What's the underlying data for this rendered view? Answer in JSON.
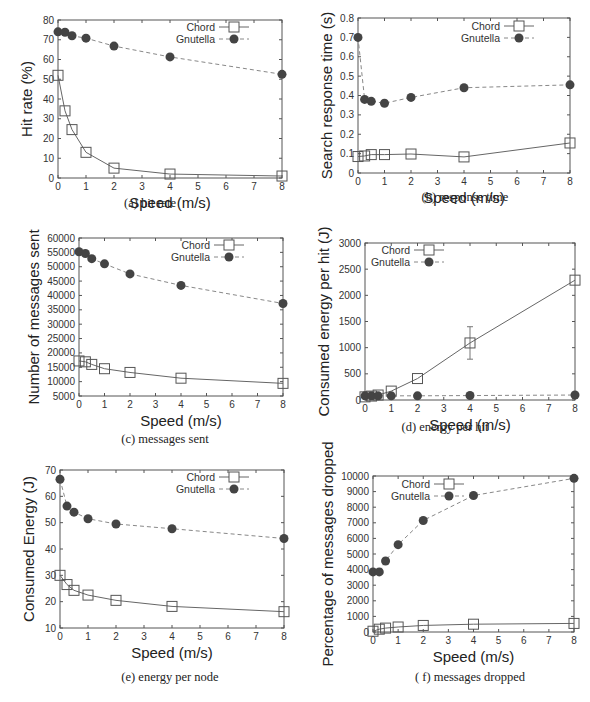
{
  "figure": {
    "legend": {
      "series": [
        "Chord",
        "Gnutella"
      ]
    },
    "colors": {
      "chord": "#555555",
      "gnutella": "#444444",
      "frame": "#555555"
    }
  },
  "chart_data": [
    {
      "id": "a",
      "type": "line",
      "caption": "(a) hit rate",
      "title": "",
      "xlabel": "Speed (m/s)",
      "ylabel": "Hit rate (%)",
      "xlim": [
        0,
        8
      ],
      "ylim": [
        0,
        80
      ],
      "xticks": [
        0,
        1,
        2,
        3,
        4,
        5,
        6,
        7,
        8
      ],
      "yticks": [
        0,
        10,
        20,
        30,
        40,
        50,
        60,
        70,
        80
      ],
      "grid": false,
      "legend_position": "top-right",
      "x": [
        0,
        0.25,
        0.5,
        1,
        2,
        4,
        8
      ],
      "series": [
        {
          "name": "Chord",
          "marker": "open-square",
          "line": "solid",
          "values": [
            52,
            34,
            24.5,
            13,
            5,
            2,
            1
          ]
        },
        {
          "name": "Gnutella",
          "marker": "filled-circle",
          "line": "dashed",
          "values": [
            74,
            73.8,
            72,
            70.8,
            66.8,
            61.3,
            52.5
          ]
        }
      ],
      "frame": {
        "left": 58,
        "top": 20,
        "right": 282,
        "bottom": 178
      }
    },
    {
      "id": "b",
      "type": "line",
      "caption": "(b) response time",
      "title": "",
      "xlabel": "Speed (m/s)",
      "ylabel": "Search response time (s)",
      "xlim": [
        0,
        8
      ],
      "ylim": [
        0,
        0.8
      ],
      "xticks": [
        0,
        1,
        2,
        3,
        4,
        5,
        6,
        7,
        8
      ],
      "yticks": [
        0,
        0.1,
        0.2,
        0.3,
        0.4,
        0.5,
        0.6,
        0.7,
        0.8
      ],
      "grid": false,
      "legend_position": "top-right",
      "x": [
        0,
        0.25,
        0.5,
        1,
        2,
        4,
        8
      ],
      "series": [
        {
          "name": "Chord",
          "marker": "open-square",
          "line": "solid",
          "values": [
            0.085,
            0.088,
            0.095,
            0.095,
            0.098,
            0.083,
            0.155
          ]
        },
        {
          "name": "Gnutella",
          "marker": "filled-circle",
          "line": "dashed",
          "values": [
            0.7,
            0.38,
            0.37,
            0.36,
            0.39,
            0.44,
            0.455
          ]
        }
      ],
      "frame": {
        "left": 358,
        "top": 18,
        "right": 570,
        "bottom": 173
      }
    },
    {
      "id": "c",
      "type": "line",
      "caption": "(c) messages sent",
      "title": "",
      "xlabel": "Speed (m/s)",
      "ylabel": "Number of messages sent",
      "xlim": [
        0,
        8
      ],
      "ylim": [
        5000,
        60000
      ],
      "xticks": [
        0,
        1,
        2,
        3,
        4,
        5,
        6,
        7,
        8
      ],
      "yticks": [
        5000,
        10000,
        15000,
        20000,
        25000,
        30000,
        35000,
        40000,
        45000,
        50000,
        55000,
        60000
      ],
      "grid": false,
      "legend_position": "top-right",
      "x": [
        0,
        0.25,
        0.5,
        1,
        2,
        4,
        8
      ],
      "series": [
        {
          "name": "Chord",
          "marker": "open-square",
          "line": "solid",
          "values": [
            17200,
            16900,
            16000,
            14500,
            13200,
            11200,
            9400
          ]
        },
        {
          "name": "Gnutella",
          "marker": "filled-circle",
          "line": "dashed",
          "values": [
            55200,
            54600,
            52800,
            51000,
            47500,
            43500,
            37200
          ]
        }
      ],
      "frame": {
        "left": 79,
        "top": 238,
        "right": 283,
        "bottom": 396
      }
    },
    {
      "id": "d",
      "type": "line",
      "caption": "(d) energy per hit",
      "title": "",
      "xlabel": "Speed (m/s)",
      "ylabel": "Consumed energy per hit (J)",
      "xlim": [
        0,
        8
      ],
      "ylim": [
        0,
        3000
      ],
      "xticks": [
        0,
        1,
        2,
        3,
        4,
        5,
        6,
        7,
        8
      ],
      "yticks": [
        0,
        500,
        1000,
        1500,
        2000,
        2500,
        3000
      ],
      "grid": false,
      "legend_position": "top-left",
      "error_bars": {
        "Chord": {
          "x": 4,
          "low": 780,
          "high": 1400
        }
      },
      "x": [
        0,
        0.25,
        0.5,
        1,
        2,
        4,
        8
      ],
      "series": [
        {
          "name": "Chord",
          "marker": "open-square",
          "line": "solid",
          "values": [
            60,
            75,
            95,
            170,
            410,
            1090,
            2290
          ]
        },
        {
          "name": "Gnutella",
          "marker": "filled-circle",
          "line": "dashed",
          "values": [
            80,
            80,
            80,
            80,
            80,
            85,
            95
          ]
        }
      ],
      "frame": {
        "left": 365,
        "top": 243,
        "right": 575,
        "bottom": 400
      }
    },
    {
      "id": "e",
      "type": "line",
      "caption": "(e) energy per node",
      "title": "",
      "xlabel": "Speed (m/s)",
      "ylabel": "Consumed Energy (J)",
      "xlim": [
        0,
        8
      ],
      "ylim": [
        10,
        70
      ],
      "xticks": [
        0,
        1,
        2,
        3,
        4,
        5,
        6,
        7,
        8
      ],
      "yticks": [
        10,
        20,
        30,
        40,
        50,
        60,
        70
      ],
      "grid": false,
      "legend_position": "top-right",
      "x": [
        0,
        0.25,
        0.5,
        1,
        2,
        4,
        8
      ],
      "series": [
        {
          "name": "Chord",
          "marker": "open-square",
          "line": "solid",
          "values": [
            30,
            26.5,
            24.3,
            22.5,
            20.5,
            18.2,
            16.2
          ]
        },
        {
          "name": "Gnutella",
          "marker": "filled-circle",
          "line": "dashed",
          "values": [
            66.5,
            56.3,
            54,
            51.5,
            49.5,
            47.7,
            44
          ]
        }
      ],
      "frame": {
        "left": 60,
        "top": 470,
        "right": 284,
        "bottom": 628
      }
    },
    {
      "id": "f",
      "type": "line",
      "caption": "( f) messages dropped",
      "title": "",
      "xlabel": "Speed (m/s)",
      "ylabel": "Percentage of messages dropped",
      "xlim": [
        0,
        8
      ],
      "ylim": [
        0,
        10000
      ],
      "xticks": [
        0,
        1,
        2,
        3,
        4,
        5,
        6,
        7,
        8
      ],
      "yticks": [
        0,
        1000,
        2000,
        3000,
        4000,
        5000,
        6000,
        7000,
        8000,
        9000,
        10000
      ],
      "grid": false,
      "legend_position": "top-center",
      "x": [
        0,
        0.25,
        0.5,
        1,
        2,
        4,
        8
      ],
      "series": [
        {
          "name": "Chord",
          "marker": "open-square",
          "line": "solid",
          "values": [
            50,
            180,
            250,
            320,
            420,
            500,
            550
          ]
        },
        {
          "name": "Gnutella",
          "marker": "filled-circle",
          "line": "dashed",
          "values": [
            3850,
            3850,
            4550,
            5600,
            7150,
            8750,
            9850
          ]
        }
      ],
      "frame": {
        "left": 373,
        "top": 476,
        "right": 574,
        "bottom": 632
      }
    }
  ]
}
